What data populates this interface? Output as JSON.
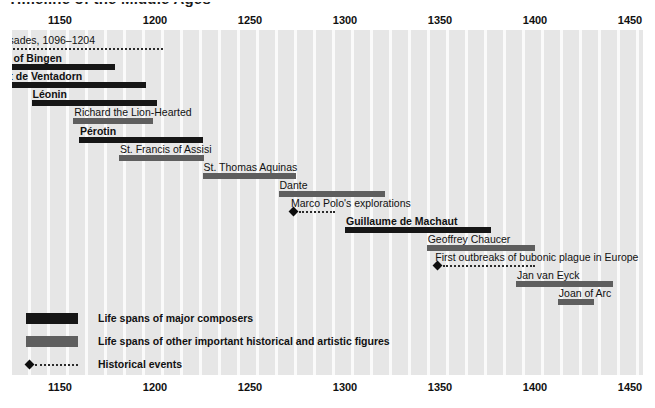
{
  "title": "Timeline of the Middle Ages",
  "chart_data": {
    "type": "bar",
    "orientation": "horizontal-timeline",
    "title": "Timeline of the Middle Ages",
    "xlabel": "",
    "ylabel": "",
    "xlim": [
      1090,
      1470
    ],
    "ticks": [
      {
        "label": "1150",
        "year": 1150
      },
      {
        "label": "1200",
        "year": 1200
      },
      {
        "label": "1250",
        "year": 1250
      },
      {
        "label": "1300",
        "year": 1300
      },
      {
        "label": "1350",
        "year": 1350
      },
      {
        "label": "1400",
        "year": 1400
      },
      {
        "label": "1450",
        "year": 1450
      }
    ],
    "grid": "vertical decade stripes",
    "legend_position": "inside-bottom-left",
    "rows": [
      {
        "label": "Age of Crusades, 1096–1204",
        "kind": "event-span",
        "bold": false,
        "start": 1096,
        "end": 1204
      },
      {
        "label": "Hildegard of Bingen",
        "kind": "composer",
        "bold": true,
        "start": 1098,
        "end": 1179
      },
      {
        "label": "Bernart de Ventadorn",
        "kind": "composer",
        "bold": true,
        "start": 1105,
        "end": 1195
      },
      {
        "label": "Léonin",
        "kind": "composer",
        "bold": true,
        "start": 1135,
        "end": 1201
      },
      {
        "label": "Richard the Lion-Hearted",
        "kind": "figure",
        "bold": false,
        "start": 1157,
        "end": 1199
      },
      {
        "label": "Pérotin",
        "kind": "composer",
        "bold": true,
        "start": 1160,
        "end": 1225
      },
      {
        "label": "St. Francis of Assisi",
        "kind": "figure",
        "bold": false,
        "start": 1181,
        "end": 1226
      },
      {
        "label": "St. Thomas Aquinas",
        "kind": "figure",
        "bold": false,
        "start": 1225,
        "end": 1274
      },
      {
        "label": "Dante",
        "kind": "figure",
        "bold": false,
        "start": 1265,
        "end": 1321
      },
      {
        "label": "Marco Polo's explorations",
        "kind": "event",
        "bold": false,
        "start": 1271,
        "end": 1295
      },
      {
        "label": "Guillaume de Machaut",
        "kind": "composer",
        "bold": true,
        "start": 1300,
        "end": 1377
      },
      {
        "label": "Geoffrey Chaucer",
        "kind": "figure",
        "bold": false,
        "start": 1343,
        "end": 1400
      },
      {
        "label": "First outbreaks of bubonic plague in Europe",
        "kind": "event",
        "bold": false,
        "start": 1347,
        "end": 1400
      },
      {
        "label": "Jan van Eyck",
        "kind": "figure",
        "bold": false,
        "start": 1390,
        "end": 1441
      },
      {
        "label": "Joan of Arc",
        "kind": "figure",
        "bold": false,
        "start": 1412,
        "end": 1431
      }
    ]
  },
  "legend": {
    "items": [
      {
        "swatch": "composer",
        "label": "Life spans of major composers"
      },
      {
        "swatch": "figure",
        "label": "Life spans of other important historical and artistic figures"
      },
      {
        "swatch": "event",
        "label": "Historical events"
      }
    ]
  },
  "colors": {
    "composer": "#161616",
    "figure": "#5e5e5e",
    "event": "#0d0d0d",
    "stripe": "#e6e6e6",
    "stripe_gap": "#fafafa",
    "text": "#111111",
    "background": "#ffffff"
  }
}
